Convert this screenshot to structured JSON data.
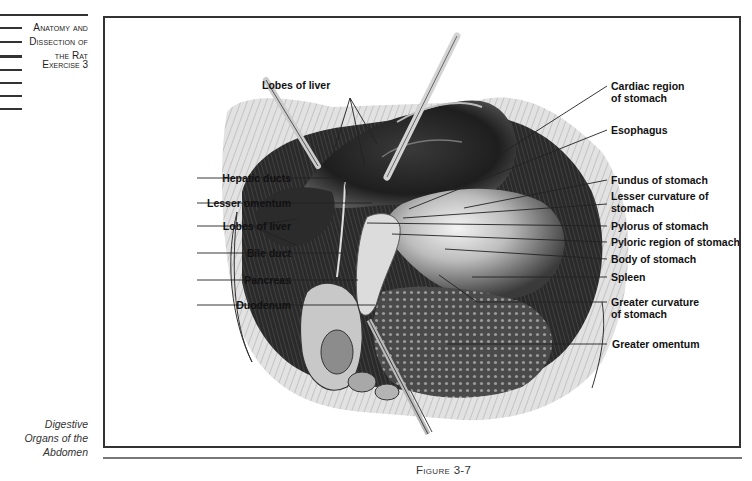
{
  "margin": {
    "chapter_title_lines": [
      "Anatomy and",
      "Dissection of",
      "the Rat"
    ],
    "exercise": "Exercise 3",
    "section_caption_lines": [
      "Digestive",
      "Organs of the",
      "Abdomen"
    ]
  },
  "figure": {
    "caption": "Figure 3-7",
    "labels": {
      "top": [
        {
          "text": "Lobes of liver"
        }
      ],
      "left": [
        {
          "text": "Hepatic ducts"
        },
        {
          "text": "Lesser omentum"
        },
        {
          "text": "Lobes of liver"
        },
        {
          "text": "Bile duct"
        },
        {
          "text": "Pancreas"
        },
        {
          "text": "Duodenum"
        }
      ],
      "right": [
        {
          "line1": "Cardiac region",
          "line2": "of stomach"
        },
        {
          "line1": "Esophagus"
        },
        {
          "line1": "Fundus of stomach"
        },
        {
          "line1": "Lesser curvature of",
          "line2": "stomach"
        },
        {
          "line1": "Pylorus of stomach"
        },
        {
          "line1": "Pyloric region of stomach"
        },
        {
          "line1": "Body of stomach"
        },
        {
          "line1": "Spleen"
        },
        {
          "line1": "Greater curvature",
          "line2": "of stomach"
        },
        {
          "line1": "Greater omentum"
        }
      ]
    }
  }
}
